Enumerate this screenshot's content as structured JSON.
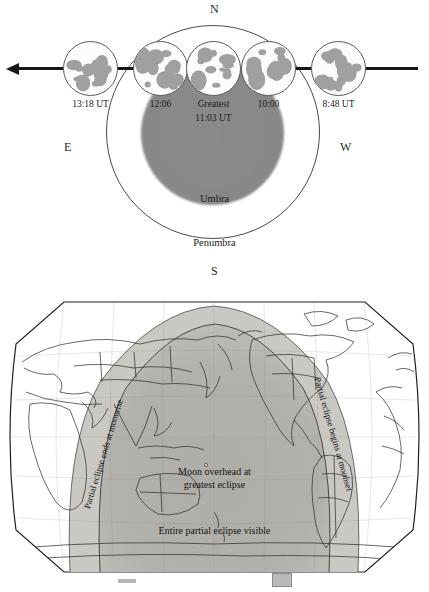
{
  "figure": {
    "colors": {
      "umbra_fill": "#8a8a8a",
      "penumbra_outline": "#4a4a4a",
      "moon_path": "#161616",
      "visibility_light": "#c9c8c2",
      "visibility_dark": "#a9a8a2",
      "map_outline": "#222222",
      "ink": "#1a1a1a"
    }
  },
  "eclipse_diagram": {
    "compass": {
      "north": "N",
      "south": "S",
      "east": "E",
      "west": "W"
    },
    "shadow_regions": {
      "umbra_label": "Umbra",
      "penumbra_label": "Penumbra"
    },
    "moon_path": {
      "direction_icon": "left-arrow",
      "moons": [
        {
          "time": "13:18 UT",
          "phase": "full",
          "shadow_fraction": 0.0
        },
        {
          "time": "12:06",
          "phase": "full",
          "shadow_fraction": 0.0
        },
        {
          "time": "Greatest",
          "time_second_line": "11:03 UT",
          "phase": "partial",
          "shadow_fraction": 0.55
        },
        {
          "time": "10:00",
          "phase": "full",
          "shadow_fraction": 0.0
        },
        {
          "time": "8:48 UT",
          "phase": "full",
          "shadow_fraction": 0.0
        }
      ]
    }
  },
  "visibility_map": {
    "projection": "oval world map",
    "labels": {
      "center_line1": "Moon overhead at",
      "center_line2": "greatest eclipse",
      "bottom": "Entire partial eclipse visible",
      "left_rotated": "Partial eclipse ends at moonrise",
      "right_rotated": "Partial eclipse begins at moonset"
    },
    "marker": "greatest-eclipse-point"
  }
}
